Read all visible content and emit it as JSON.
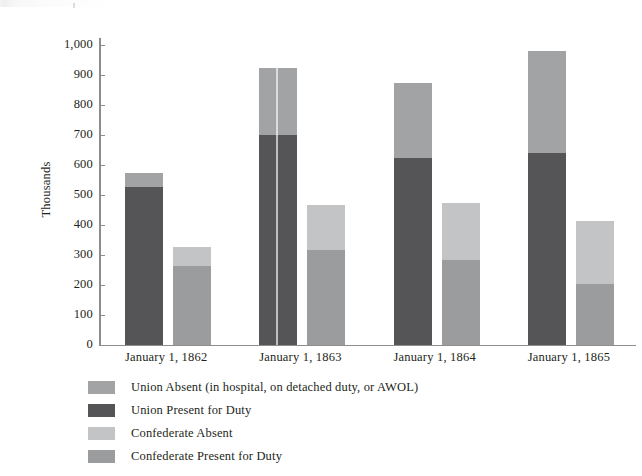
{
  "chart_data": {
    "type": "bar",
    "title": "",
    "subtitle": "",
    "xlabel": "",
    "ylabel": "Thousands",
    "ylim": [
      0,
      1000
    ],
    "yticks": [
      "0",
      "100",
      "200",
      "300",
      "400",
      "500",
      "600",
      "700",
      "800",
      "900",
      "1,000"
    ],
    "ytick_values": [
      0,
      100,
      200,
      300,
      400,
      500,
      600,
      700,
      800,
      900,
      1000
    ],
    "grid": false,
    "stacked": true,
    "legend_position": "below-left",
    "categories": [
      "January 1, 1862",
      "January 1, 1863",
      "January 1, 1864",
      "January 1, 1865"
    ],
    "series": [
      {
        "name": "Union Present for Duty",
        "color": "#555557",
        "values": [
          527,
          700,
          622,
          640
        ]
      },
      {
        "name": "Union Absent (in hospital, on detached duty, or AWOL)",
        "color": "#a2a3a5",
        "values": [
          48,
          222,
          253,
          340
        ]
      },
      {
        "name": "Confederate Present for Duty",
        "color": "#9b9c9e",
        "values": [
          262,
          317,
          285,
          205
        ]
      },
      {
        "name": "Confederate Absent",
        "color": "#c3c4c5",
        "values": [
          65,
          150,
          187,
          210
        ]
      }
    ],
    "stack_totals": {
      "union": [
        575,
        922,
        875,
        980
      ],
      "confederate": [
        327,
        467,
        472,
        415
      ]
    },
    "annotations": []
  },
  "legend": {
    "items": [
      {
        "label": "Union Absent (in hospital, on detached duty, or AWOL)",
        "color": "#a2a3a5"
      },
      {
        "label": "Union Present for Duty",
        "color": "#555557"
      },
      {
        "label": "Confederate Absent",
        "color": "#c3c4c5"
      },
      {
        "label": "Confederate Present for Duty",
        "color": "#9b9c9e"
      }
    ]
  },
  "axis": {
    "y_label": "Thousands",
    "y_ticks": [
      "1,000",
      "900",
      "800",
      "700",
      "600",
      "500",
      "400",
      "300",
      "200",
      "100",
      "0"
    ],
    "x_ticks": [
      "January 1, 1862",
      "January 1, 1863",
      "January 1, 1864",
      "January 1, 1865"
    ]
  },
  "colors": {
    "union_present": "#555557",
    "union_absent": "#a2a3a5",
    "confederate_present": "#9b9c9e",
    "confederate_absent": "#c3c4c5",
    "axis": "#8d8d8d",
    "text": "#231f20",
    "background": "#ffffff"
  }
}
